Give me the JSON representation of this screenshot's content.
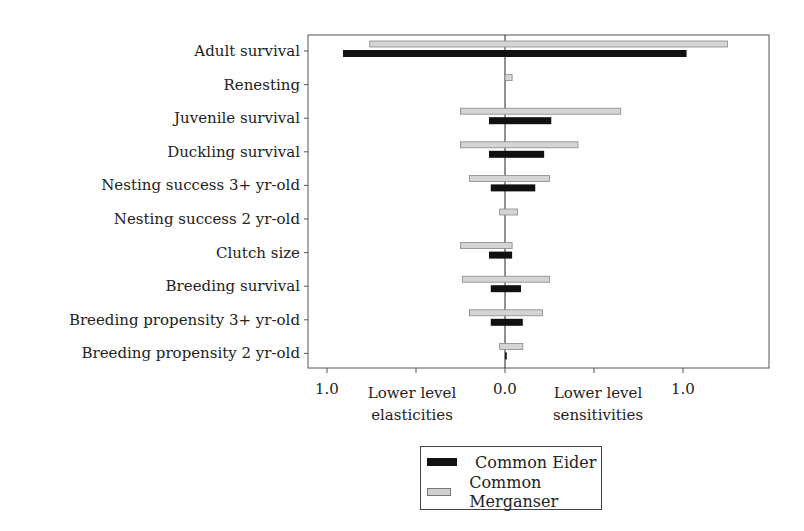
{
  "chart_data": {
    "type": "bar",
    "orientation": "horizontal",
    "title": "",
    "categories": [
      "Adult survival",
      "Renesting",
      "Juvenile survival",
      "Duckling survival",
      "Nesting success 3+ yr-old",
      "Nesting success 2 yr-old",
      "Clutch size",
      "Breeding survival",
      "Breeding propensity 3+ yr-old",
      "Breeding propensity 2 yr-old"
    ],
    "series": [
      {
        "name": "Common Merganser",
        "color": "#d0d0d0",
        "elasticities": [
          0.76,
          0.0,
          0.25,
          0.25,
          0.2,
          0.03,
          0.25,
          0.24,
          0.2,
          0.03
        ],
        "sensitivities": [
          1.25,
          0.04,
          0.65,
          0.41,
          0.25,
          0.07,
          0.04,
          0.25,
          0.21,
          0.1
        ]
      },
      {
        "name": "Common Eider",
        "color": "#111111",
        "elasticities": [
          0.91,
          0.0,
          0.09,
          0.09,
          0.08,
          0.0,
          0.09,
          0.08,
          0.08,
          0.0
        ],
        "sensitivities": [
          1.02,
          0.0,
          0.26,
          0.22,
          0.17,
          0.0,
          0.04,
          0.09,
          0.1,
          0.01
        ]
      }
    ],
    "x_ticks": [
      "1.0",
      "0.0",
      "1.0"
    ],
    "xlabel_left": "Lower level elasticities",
    "xlabel_right": "Lower level sensitivities",
    "legend_position": "bottom"
  },
  "axis": {
    "tick_left": "1.0",
    "tick_center": "0.0",
    "tick_right": "1.0",
    "label_left_1": "Lower level",
    "label_left_2": "elasticities",
    "label_right_1": "Lower level",
    "label_right_2": "sensitivities"
  },
  "legend": {
    "eider": "Common Eider",
    "merganser": "Common Merganser"
  }
}
